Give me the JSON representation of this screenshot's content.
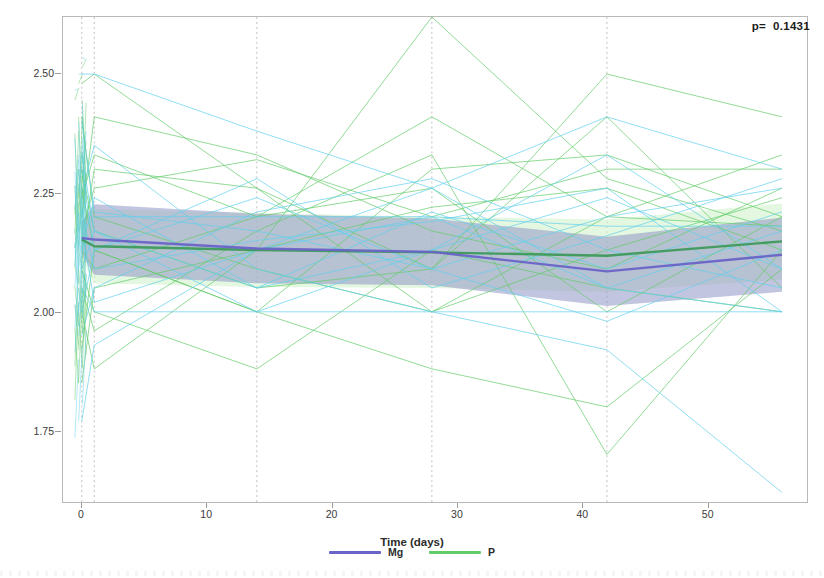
{
  "chart_data": {
    "type": "line",
    "title": "",
    "subtitle": "",
    "xlabel": "Time (days)",
    "ylabel": "Serum magnesium levels",
    "xlim": [
      -1.5,
      58
    ],
    "ylim": [
      1.6,
      2.62
    ],
    "xticks": [
      0,
      10,
      20,
      30,
      40,
      50
    ],
    "xtick_labels": [
      "0",
      "10",
      "20",
      "30",
      "40",
      "50"
    ],
    "yticks": [
      1.75,
      2.0,
      2.25,
      2.5
    ],
    "ytick_labels": [
      "1.75",
      "2.00",
      "2.25",
      "2.50"
    ],
    "grid": "vertical dashed gridlines at measurement days",
    "gridlines_x": [
      0,
      1,
      14,
      28,
      42
    ],
    "legend_position": "bottom-center",
    "annotation": "p=  0.1431",
    "p_value": "0.1431",
    "series": [
      {
        "name": "Mg",
        "color": "#6a63c8",
        "band_color": "#8f96c4",
        "spaghetti_color": "#62d0ee",
        "x": [
          0,
          1,
          14,
          28,
          42,
          56
        ],
        "mean": [
          2.155,
          2.152,
          2.133,
          2.126,
          2.085,
          2.12
        ],
        "ci_lower": [
          2.12,
          2.078,
          2.06,
          2.056,
          2.012,
          2.042
        ],
        "ci_upper": [
          2.19,
          2.226,
          2.206,
          2.196,
          2.158,
          2.198
        ]
      },
      {
        "name": "P",
        "color": "#3f9a5a",
        "band_color": "#cdf0c8",
        "spaghetti_color": "#63cc6a",
        "x": [
          0,
          1,
          14,
          28,
          42,
          56
        ],
        "mean": [
          2.152,
          2.138,
          2.13,
          2.125,
          2.118,
          2.148
        ],
        "ci_lower": [
          2.112,
          2.06,
          2.052,
          2.05,
          2.042,
          2.068
        ],
        "ci_upper": [
          2.192,
          2.216,
          2.208,
          2.2,
          2.194,
          2.228
        ]
      }
    ],
    "individual_traces": {
      "description": "per-subject spaghetti lines drawn for both groups across measurement days",
      "Mg": [
        [
          2.5,
          2.5,
          2.38,
          2.26,
          2.41,
          2.3
        ],
        [
          2.17,
          2.2,
          2.2,
          2.2,
          2.18,
          2.18
        ],
        [
          1.77,
          1.93,
          2.13,
          2.2,
          2.05,
          2.0
        ],
        [
          2.09,
          2.17,
          2.0,
          2.13,
          2.33,
          2.09
        ],
        [
          2.3,
          2.13,
          2.28,
          2.05,
          2.16,
          2.28
        ],
        [
          2.21,
          2.09,
          2.15,
          2.19,
          2.26,
          2.0
        ],
        [
          2.05,
          2.0,
          2.0,
          2.0,
          2.0,
          2.0
        ],
        [
          2.13,
          2.24,
          2.05,
          2.21,
          2.09,
          2.21
        ],
        [
          2.4,
          2.21,
          2.17,
          2.09,
          1.98,
          2.13
        ],
        [
          1.95,
          2.05,
          2.21,
          2.28,
          2.13,
          2.05
        ],
        [
          2.25,
          2.35,
          2.09,
          2.0,
          1.92,
          1.62
        ],
        [
          2.0,
          2.13,
          2.24,
          2.09,
          2.2,
          2.26
        ],
        [
          2.18,
          2.02,
          2.13,
          2.26,
          2.05,
          2.17
        ],
        [
          2.33,
          2.17,
          2.05,
          2.13,
          2.24,
          2.09
        ]
      ],
      "P": [
        [
          2.48,
          2.5,
          2.26,
          2.09,
          2.5,
          2.41
        ],
        [
          2.24,
          2.33,
          2.2,
          2.41,
          2.2,
          2.33
        ],
        [
          2.0,
          1.88,
          2.13,
          2.62,
          2.28,
          2.17
        ],
        [
          2.17,
          2.26,
          2.32,
          2.2,
          2.3,
          2.3
        ],
        [
          2.09,
          2.0,
          1.88,
          2.13,
          2.05,
          2.0
        ],
        [
          2.41,
          2.2,
          2.09,
          2.0,
          2.13,
          2.24
        ],
        [
          2.13,
          2.09,
          2.2,
          2.26,
          2.0,
          2.2
        ],
        [
          1.92,
          2.13,
          2.0,
          1.88,
          1.8,
          2.09
        ],
        [
          2.2,
          2.41,
          2.33,
          2.17,
          2.09,
          2.26
        ],
        [
          2.05,
          1.96,
          2.17,
          2.33,
          1.7,
          2.13
        ],
        [
          2.3,
          2.17,
          2.05,
          2.09,
          2.41,
          2.05
        ],
        [
          2.13,
          2.3,
          2.26,
          2.0,
          2.2,
          2.18
        ],
        [
          1.85,
          2.05,
          2.13,
          2.22,
          2.26,
          2.13
        ],
        [
          2.26,
          2.13,
          2.0,
          2.3,
          2.33,
          2.2
        ]
      ]
    }
  },
  "legend": {
    "items": [
      {
        "label": "Mg",
        "color": "#6a63c8"
      },
      {
        "label": "P",
        "color": "#63cc6a"
      }
    ]
  },
  "annotation": {
    "text": "p=  0.1431"
  },
  "axes": {
    "x": {
      "label": "Time (days)"
    },
    "y": {
      "label": "Serum magnesium levels"
    }
  }
}
